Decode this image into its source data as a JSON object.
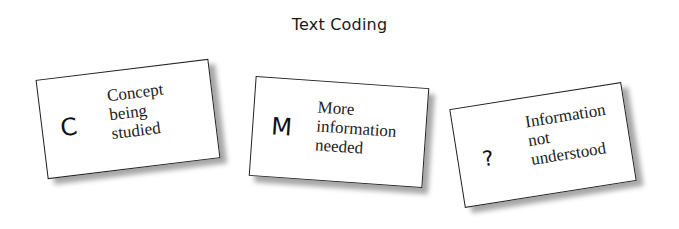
{
  "title": "Text Coding",
  "cards": [
    {
      "code": "C",
      "lines": [
        "Concept",
        "being",
        "studied"
      ]
    },
    {
      "code": "M",
      "lines": [
        "More",
        "information",
        "needed"
      ]
    },
    {
      "code": "?",
      "lines": [
        "Information",
        "not",
        "understood"
      ]
    }
  ]
}
